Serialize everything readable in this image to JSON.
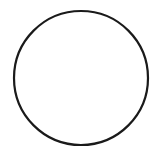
{
  "canvas": {
    "width": 156,
    "height": 153,
    "background": "#ffffff"
  },
  "shapes": [
    {
      "type": "circle",
      "cx": 81,
      "cy": 78,
      "r": 67,
      "stroke": "#1a1a1a",
      "stroke_width": 2.2,
      "fill": "none"
    }
  ]
}
